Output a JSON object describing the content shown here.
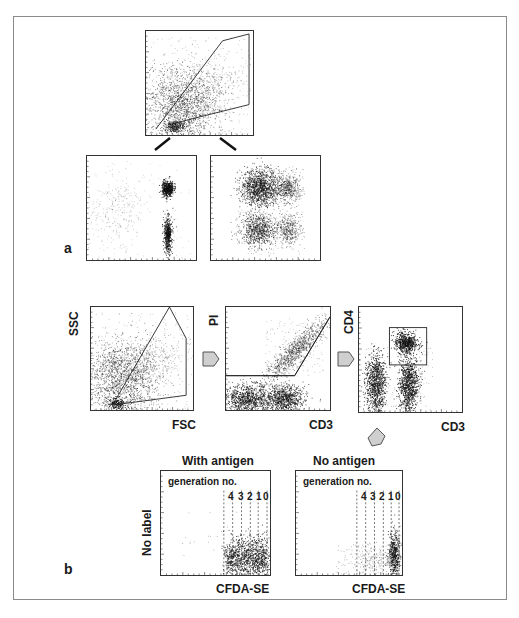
{
  "figure": {
    "panels": {
      "a": {
        "label": "a",
        "top_plot": {
          "description": "scatter with polygon gate"
        },
        "left_plot": {
          "description": "scatter, two vertical clusters on right"
        },
        "right_plot": {
          "description": "scatter, four clusters"
        }
      },
      "b": {
        "label": "b",
        "plot1": {
          "x_label": "FSC",
          "y_label": "SSC"
        },
        "plot2": {
          "x_label": "CD3",
          "y_label": "PI"
        },
        "plot3": {
          "x_label": "CD3",
          "y_label": "CD4"
        },
        "with_antigen": {
          "title": "With antigen",
          "annotation": "generation no.",
          "generations": [
            "4",
            "3",
            "2",
            "1",
            "0"
          ],
          "x_label": "CFDA-SE",
          "y_label": "No label"
        },
        "no_antigen": {
          "title": "No antigen",
          "annotation": "generation no.",
          "generations": [
            "4",
            "3",
            "2",
            "1",
            "0"
          ],
          "x_label": "CFDA-SE"
        }
      }
    },
    "colors": {
      "frame": "#8a8a8a",
      "dots": "#111111",
      "arrow_fill": "#cfcfcf",
      "arrow_stroke": "#555555"
    }
  }
}
